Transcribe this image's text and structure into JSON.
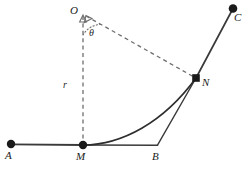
{
  "figure": {
    "type": "geometry-diagram",
    "background_color": "#ffffff",
    "stroke_color": "#3a3a3a",
    "dash_color": "#6e6e6e",
    "marker_color": "#1a1a1a",
    "width": 249,
    "height": 175
  },
  "labels": {
    "A": "A",
    "B": "B",
    "C": "C",
    "M": "M",
    "N": "N",
    "O": "O",
    "r": "r",
    "theta": "θ"
  },
  "points": [
    {
      "name": "A",
      "label": "A",
      "x": 11,
      "y": 144,
      "marker": "filled-circle",
      "radius": 4.2,
      "label_x": 7,
      "label_y": 152
    },
    {
      "name": "M",
      "label": "M",
      "x": 83,
      "y": 145,
      "marker": "filled-circle",
      "radius": 4.2,
      "label_x": 77,
      "label_y": 153
    },
    {
      "name": "B",
      "label": "B",
      "x": 157,
      "y": 145,
      "marker": "none",
      "radius": 0,
      "label_x": 153,
      "label_y": 153
    },
    {
      "name": "N",
      "label": "N",
      "x": 196,
      "y": 78,
      "marker": "filled-square",
      "radius": 3.8,
      "label_x": 202,
      "label_y": 78
    },
    {
      "name": "C",
      "label": "C",
      "x": 233,
      "y": 8,
      "marker": "filled-circle",
      "radius": 4.2,
      "label_x": 236,
      "label_y": 14
    },
    {
      "name": "O",
      "label": "O",
      "x": 83,
      "y": 14,
      "marker": "none",
      "radius": 0,
      "label_x": 72,
      "label_y": 8
    }
  ],
  "segments": [
    {
      "name": "segment-AM",
      "from": "A",
      "to": "M",
      "style": "solid",
      "x1": 11,
      "y1": 144,
      "x2": 83,
      "y2": 145
    },
    {
      "name": "segment-MB",
      "from": "M",
      "to": "B",
      "style": "solid",
      "x1": 83,
      "y1": 145,
      "x2": 157,
      "y2": 145
    },
    {
      "name": "segment-BN",
      "from": "B",
      "to": "N",
      "style": "solid",
      "x1": 157,
      "y1": 145,
      "x2": 196,
      "y2": 78
    },
    {
      "name": "segment-NC",
      "from": "N",
      "to": "C",
      "style": "solid",
      "x1": 196,
      "y1": 78,
      "x2": 233,
      "y2": 8
    },
    {
      "name": "radius-OM",
      "from": "O",
      "to": "M",
      "style": "dashed",
      "x1": 83,
      "y1": 16,
      "x2": 83,
      "y2": 145
    },
    {
      "name": "radius-ON",
      "from": "O",
      "to": "N",
      "style": "dashed",
      "x1": 86,
      "y1": 16,
      "x2": 194,
      "y2": 77
    }
  ],
  "curve": {
    "name": "arc-MN",
    "from": "M",
    "to": "N",
    "style": "solid",
    "description": "concave-up curve from M rising to N",
    "path": "M 83 145 C 120 144 160 122 196 78"
  },
  "angle_arc": {
    "name": "angle-theta-at-O",
    "vertex": "O",
    "style": "dotted",
    "radius": 19,
    "path": "M 83 33 A 19 19 0 0 1 99 25"
  },
  "length_markers": [
    {
      "name": "radius-length-r",
      "label": "r",
      "x": 66,
      "y": 84
    }
  ],
  "angle_markers": [
    {
      "name": "angle-theta",
      "label": "θ",
      "x": 90,
      "y": 32
    }
  ],
  "arrowheads": [
    {
      "name": "arrowhead-OM-at-O",
      "points": "83,16 80,22 86,22"
    },
    {
      "name": "arrowhead-ON-at-O",
      "points": "86,16 85,23 92,19"
    }
  ]
}
